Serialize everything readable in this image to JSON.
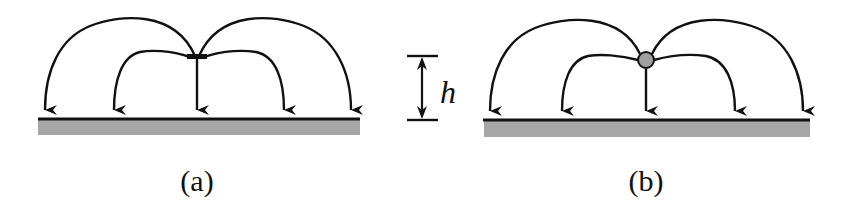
{
  "figure": {
    "panels": [
      {
        "id": "a",
        "caption": "(a)",
        "source_shape": "bar",
        "description": "Field lines from a flat bar source curving down to ground plane"
      },
      {
        "id": "b",
        "caption": "(b)",
        "source_shape": "circle",
        "description": "Field lines from a point (circular) source curving down to ground plane"
      }
    ],
    "height_marker": {
      "label": "h"
    },
    "colors": {
      "line": "#111111",
      "ground": "#a6a6a6",
      "source_fill": "#a0a0a0"
    }
  }
}
